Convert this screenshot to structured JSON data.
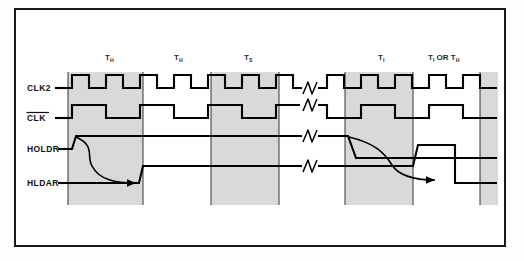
{
  "figure": {
    "kind": "timing-diagram",
    "title_visible": false,
    "background_color": "#ffffff",
    "frame_color": "#1a1a1a",
    "shade_color": "#d8d8d8",
    "wave_color": "#000000"
  },
  "signals": [
    {
      "name": "CLK2",
      "label": "CLK2",
      "overbar": false,
      "row_y": 88
    },
    {
      "name": "CLK",
      "label": "CLK",
      "overbar": true,
      "row_y": 117
    },
    {
      "name": "HOLDR",
      "label": "HOLDR",
      "overbar": false,
      "row_y": 149
    },
    {
      "name": "HLDAR",
      "label": "HLDAR",
      "overbar": false,
      "row_y": 183
    }
  ],
  "states": [
    {
      "base": "T",
      "sub": "H",
      "label": "T",
      "x": 113
    },
    {
      "base": "T",
      "sub": "H",
      "label": "T",
      "x": 180
    },
    {
      "base": "T",
      "sub": "S",
      "label": "T",
      "x": 252
    },
    {
      "base": "T",
      "sub": "I",
      "label": "T",
      "x": 385
    },
    {
      "base": "T",
      "sub": "I",
      "label": "T",
      "x": 443,
      "suffix": " OR T",
      "suffix_sub": "H"
    }
  ],
  "gridlines_x": [
    68,
    143,
    211,
    279,
    345,
    413,
    480
  ],
  "shaded_bands": [
    {
      "x": 68,
      "width": 75
    },
    {
      "x": 211,
      "width": 68
    },
    {
      "x": 345,
      "width": 68
    },
    {
      "x": 480,
      "width": 16
    }
  ],
  "break_marks": [
    {
      "x": 310,
      "y": 99,
      "signal": "CLK2"
    },
    {
      "x": 310,
      "y": 120,
      "signal": "CLK"
    },
    {
      "x": 310,
      "y": 142,
      "signal": "HOLDR"
    },
    {
      "x": 310,
      "y": 174,
      "signal": "HLDAR"
    }
  ],
  "annotations": [
    {
      "name": "hold-request-to-ack-arrow",
      "from_signal": "HOLDR",
      "to_signal": "HLDAR",
      "direction": "rising"
    },
    {
      "name": "hold-release-to-deack-arrow",
      "from_signal": "HOLDR",
      "to_signal": "HLDAR",
      "direction": "falling"
    }
  ]
}
